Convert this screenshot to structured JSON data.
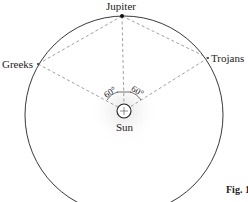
{
  "diagram": {
    "labels": {
      "jupiter": "Jupiter",
      "greeks": "Greeks",
      "trojans": "Trojans",
      "sun": "Sun"
    },
    "angles": {
      "left": "60°",
      "right": "60°"
    },
    "caption": "Fig. 1",
    "colors": {
      "line": "#222222",
      "dashed": "#777777",
      "background": "#ffffff"
    }
  }
}
